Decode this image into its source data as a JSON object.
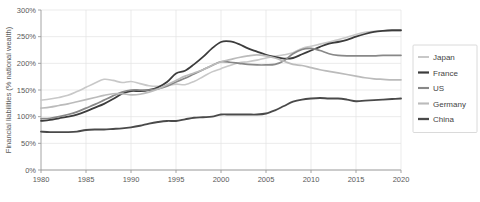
{
  "chart_data": {
    "type": "line",
    "title": "",
    "subtitle": "",
    "xlabel": "",
    "ylabel": "Financial liabilities (% national wealth)",
    "xlim": [
      1980,
      2020
    ],
    "ylim": [
      0,
      300
    ],
    "grid": true,
    "legend_position": "right",
    "x_ticks": [
      1980,
      1985,
      1990,
      1995,
      2000,
      2005,
      2010,
      2015,
      2020
    ],
    "x_tick_labels": [
      "1980",
      "1985",
      "1990",
      "1995",
      "2000",
      "2005",
      "2010",
      "2015",
      "2020"
    ],
    "y_ticks": [
      0,
      50,
      100,
      150,
      200,
      250,
      300
    ],
    "y_tick_labels": [
      "0%",
      "50%",
      "100%",
      "150%",
      "200%",
      "250%",
      "300%"
    ],
    "x": [
      1980,
      1981,
      1982,
      1983,
      1984,
      1985,
      1986,
      1987,
      1988,
      1989,
      1990,
      1991,
      1992,
      1993,
      1994,
      1995,
      1996,
      1997,
      1998,
      1999,
      2000,
      2001,
      2002,
      2003,
      2004,
      2005,
      2006,
      2007,
      2008,
      2009,
      2010,
      2011,
      2012,
      2013,
      2014,
      2015,
      2016,
      2017,
      2018,
      2019,
      2020
    ],
    "series": [
      {
        "name": "Japan",
        "color": "#c8c8c8",
        "width": 1.6,
        "values": [
          131,
          133,
          136,
          140,
          147,
          155,
          163,
          170,
          168,
          164,
          166,
          162,
          158,
          157,
          158,
          161,
          160,
          166,
          175,
          184,
          190,
          196,
          201,
          203,
          206,
          210,
          213,
          216,
          220,
          228,
          232,
          236,
          240,
          244,
          249,
          254,
          258,
          260,
          261,
          261,
          261
        ]
      },
      {
        "name": "France",
        "color": "#3c3c3c",
        "width": 1.8,
        "values": [
          92,
          94,
          97,
          100,
          104,
          110,
          117,
          124,
          133,
          143,
          148,
          148,
          150,
          155,
          165,
          181,
          186,
          198,
          212,
          228,
          240,
          241,
          236,
          228,
          222,
          216,
          212,
          209,
          210,
          217,
          224,
          231,
          237,
          240,
          244,
          250,
          255,
          259,
          261,
          262,
          262
        ]
      },
      {
        "name": "US",
        "color": "#888888",
        "width": 1.7,
        "values": [
          96,
          97,
          100,
          104,
          109,
          116,
          123,
          131,
          139,
          146,
          150,
          150,
          150,
          152,
          157,
          165,
          172,
          180,
          188,
          196,
          203,
          202,
          200,
          198,
          197,
          197,
          198,
          205,
          218,
          226,
          228,
          224,
          218,
          215,
          214,
          214,
          214,
          214,
          215,
          215,
          215
        ]
      },
      {
        "name": "Germany",
        "color": "#bbbbbb",
        "width": 1.7,
        "values": [
          116,
          118,
          121,
          124,
          128,
          132,
          136,
          140,
          143,
          143,
          141,
          142,
          146,
          152,
          160,
          168,
          176,
          182,
          188,
          196,
          203,
          207,
          211,
          214,
          216,
          214,
          210,
          204,
          198,
          196,
          192,
          188,
          185,
          182,
          179,
          176,
          173,
          171,
          170,
          169,
          169
        ]
      },
      {
        "name": "China",
        "color": "#4a4a4a",
        "width": 1.9,
        "values": [
          72,
          71,
          71,
          71,
          72,
          75,
          76,
          76,
          77,
          78,
          80,
          83,
          87,
          90,
          92,
          92,
          95,
          98,
          99,
          100,
          104,
          104,
          104,
          104,
          104,
          106,
          112,
          120,
          128,
          132,
          134,
          135,
          134,
          134,
          132,
          129,
          130,
          131,
          132,
          133,
          134
        ]
      }
    ],
    "legend_entries": [
      {
        "label": "Japan",
        "color": "#c8c8c8",
        "width": 1.6
      },
      {
        "label": "France",
        "color": "#3c3c3c",
        "width": 1.8
      },
      {
        "label": "US",
        "color": "#888888",
        "width": 1.7
      },
      {
        "label": "Germany",
        "color": "#bbbbbb",
        "width": 1.7
      },
      {
        "label": "China",
        "color": "#4a4a4a",
        "width": 1.9
      }
    ],
    "colors": {
      "grid": "#e2e2e2",
      "axis": "#9a9a9a",
      "text": "#5a5a5a",
      "legend_border": "#d0d0d0",
      "background": "#ffffff"
    }
  }
}
